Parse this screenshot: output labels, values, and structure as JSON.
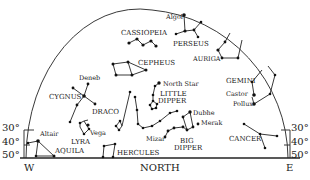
{
  "directions": {
    "west": "W",
    "north": "NORTH",
    "east": "E"
  },
  "altitude_ticks": [
    "30°",
    "40°",
    "50°"
  ],
  "constellations": [
    {
      "id": "cassiopeia",
      "label": "CASSIOPEIA"
    },
    {
      "id": "perseus",
      "label": "PERSEUS"
    },
    {
      "id": "auriga",
      "label": "AURIGA"
    },
    {
      "id": "cepheus",
      "label": "CEPHEUS"
    },
    {
      "id": "cygnus",
      "label": "CYGNUS"
    },
    {
      "id": "draco",
      "label": "DRACO"
    },
    {
      "id": "little-dipper",
      "label": "LITTLE DIPPER",
      "line1": "LITTLE",
      "line2": "DIPPER"
    },
    {
      "id": "gemini",
      "label": "GEMINI"
    },
    {
      "id": "lyra",
      "label": "LYRA"
    },
    {
      "id": "aquila",
      "label": "AQUILA"
    },
    {
      "id": "hercules",
      "label": "HERCULES"
    },
    {
      "id": "big-dipper",
      "label": "BIG DIPPER",
      "line1": "BIG",
      "line2": "DIPPER"
    },
    {
      "id": "cancer",
      "label": "CANCER"
    }
  ],
  "stars": {
    "algol": "Algol",
    "deneb": "Deneb",
    "north_star": "North Star",
    "castor": "Castor",
    "pollux": "Pollux",
    "dubhe": "Dubhe",
    "merak": "Merak",
    "mizar": "Mizar",
    "vega": "Vega",
    "altair": "Altair"
  }
}
